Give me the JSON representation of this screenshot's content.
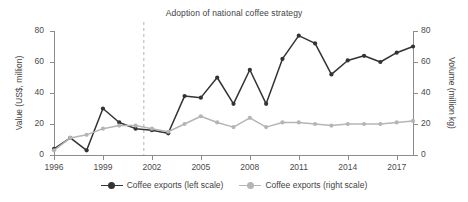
{
  "chart_data": {
    "type": "line",
    "title": "Adoption of national coffee strategy",
    "xlabel": "",
    "x": [
      1996,
      1997,
      1998,
      1999,
      2000,
      2001,
      2002,
      2003,
      2004,
      2005,
      2006,
      2007,
      2008,
      2009,
      2010,
      2011,
      2012,
      2013,
      2014,
      2015,
      2016,
      2017,
      2018
    ],
    "xticks": [
      1996,
      1999,
      2002,
      2005,
      2008,
      2011,
      2014,
      2017
    ],
    "xlim": [
      1996,
      2018
    ],
    "grid": false,
    "legend_position": "bottom",
    "annotations": [
      {
        "type": "vline",
        "x": 2001.5,
        "style": "dashed",
        "color": "#c9c9c9",
        "label": "Adoption of national coffee strategy"
      }
    ],
    "series": [
      {
        "name": "Coffee exports (left scale)",
        "axis": "left",
        "ylabel": "Value (US$, million)",
        "ylim": [
          0,
          80
        ],
        "yticks": [
          0,
          20,
          40,
          60,
          80
        ],
        "color": "#333333",
        "values": [
          4,
          11,
          3,
          30,
          21,
          17,
          16,
          14,
          38,
          37,
          50,
          33,
          55,
          33,
          62,
          77,
          72,
          52,
          61,
          64,
          60,
          66,
          70
        ]
      },
      {
        "name": "Coffee exports (right scale)",
        "axis": "right",
        "ylabel": "Volume (million kg)",
        "ylim": [
          0,
          80
        ],
        "yticks": [
          0,
          20,
          40,
          60,
          80
        ],
        "color": "#b5b5b5",
        "values": [
          3,
          11,
          13,
          17,
          19,
          19,
          17,
          15,
          20,
          25,
          21,
          18,
          24,
          18,
          21,
          21,
          20,
          19,
          20,
          20,
          20,
          21,
          22
        ]
      }
    ]
  },
  "axes": {
    "left_title": "Value (US$, million)",
    "right_title": "Volume (million kg)",
    "left_ticks": [
      "80",
      "60",
      "40",
      "20",
      "0"
    ],
    "right_ticks": [
      "80",
      "60",
      "40",
      "20",
      "0"
    ],
    "x_ticks": [
      "1996",
      "1999",
      "2002",
      "2005",
      "2008",
      "2011",
      "2014",
      "2017"
    ]
  },
  "legend": {
    "items": [
      {
        "label": "Coffee exports (left scale)",
        "color": "#333333"
      },
      {
        "label": "Coffee exports (right scale)",
        "color": "#b5b5b5"
      }
    ]
  }
}
